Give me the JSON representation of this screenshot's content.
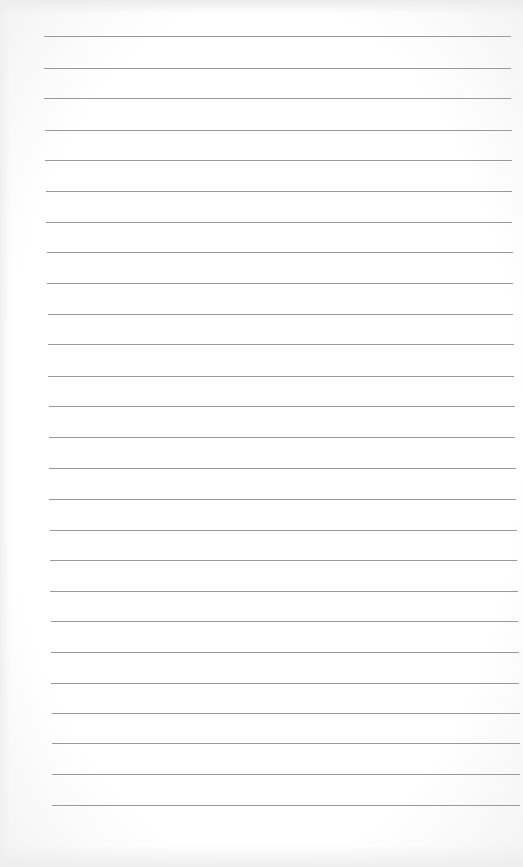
{
  "paper": {
    "type": "lined-paper",
    "background_color": "#ffffff",
    "line_color": "#9a9a9a",
    "line_count": 26,
    "lines": [
      {
        "y": 36,
        "x1": 44,
        "x2": 511
      },
      {
        "y": 68,
        "x1": 44,
        "x2": 511
      },
      {
        "y": 98,
        "x1": 44,
        "x2": 511
      },
      {
        "y": 130,
        "x1": 45,
        "x2": 512
      },
      {
        "y": 160,
        "x1": 45,
        "x2": 512
      },
      {
        "y": 191,
        "x1": 46,
        "x2": 512
      },
      {
        "y": 222,
        "x1": 46,
        "x2": 512
      },
      {
        "y": 252,
        "x1": 47,
        "x2": 513
      },
      {
        "y": 283,
        "x1": 47,
        "x2": 513
      },
      {
        "y": 314,
        "x1": 48,
        "x2": 513
      },
      {
        "y": 344,
        "x1": 48,
        "x2": 514
      },
      {
        "y": 376,
        "x1": 48,
        "x2": 514
      },
      {
        "y": 406,
        "x1": 49,
        "x2": 515
      },
      {
        "y": 437,
        "x1": 49,
        "x2": 515
      },
      {
        "y": 468,
        "x1": 49,
        "x2": 516
      },
      {
        "y": 499,
        "x1": 49,
        "x2": 516
      },
      {
        "y": 530,
        "x1": 50,
        "x2": 517
      },
      {
        "y": 560,
        "x1": 50,
        "x2": 517
      },
      {
        "y": 591,
        "x1": 50,
        "x2": 518
      },
      {
        "y": 621,
        "x1": 51,
        "x2": 518
      },
      {
        "y": 652,
        "x1": 51,
        "x2": 519
      },
      {
        "y": 683,
        "x1": 51,
        "x2": 519
      },
      {
        "y": 713,
        "x1": 52,
        "x2": 520
      },
      {
        "y": 743,
        "x1": 52,
        "x2": 520
      },
      {
        "y": 774,
        "x1": 52,
        "x2": 520
      },
      {
        "y": 805,
        "x1": 52,
        "x2": 520
      }
    ]
  }
}
